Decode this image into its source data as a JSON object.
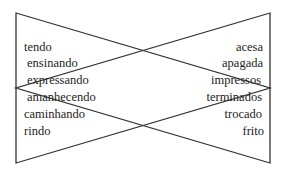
{
  "diagram": {
    "stroke_color": "#333333",
    "left_triangle": {
      "points": "16,13 16,163 270,88"
    },
    "right_triangle": {
      "points": "270,13 270,163 16,88"
    },
    "left_column": {
      "words": [
        {
          "text": "tendo",
          "x": 24,
          "y": 40
        },
        {
          "text": "ensinando",
          "x": 27,
          "y": 56
        },
        {
          "text": "expressando",
          "x": 27,
          "y": 73
        },
        {
          "text": "amanhecendo",
          "x": 27,
          "y": 90
        },
        {
          "text": "caminhando",
          "x": 24,
          "y": 107
        },
        {
          "text": "rindo",
          "x": 24,
          "y": 124
        }
      ]
    },
    "right_column": {
      "words": [
        {
          "text": "acesa",
          "right": 22,
          "y": 40
        },
        {
          "text": "apagada",
          "right": 22,
          "y": 56
        },
        {
          "text": "impressos",
          "right": 24,
          "y": 73
        },
        {
          "text": "terminados",
          "right": 23,
          "y": 90
        },
        {
          "text": "trocado",
          "right": 23,
          "y": 107
        },
        {
          "text": "frito",
          "right": 21,
          "y": 124
        }
      ]
    }
  }
}
